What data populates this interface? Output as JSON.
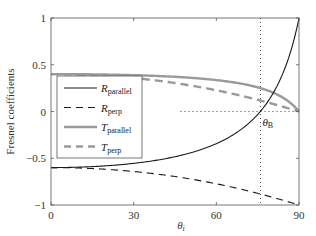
{
  "chart_data": {
    "type": "line",
    "title": "",
    "xlabel": "θi",
    "ylabel": "Fresnel coefficients",
    "xlim": [
      0,
      90
    ],
    "ylim": [
      -1,
      1
    ],
    "xticks": [
      0,
      30,
      60,
      90
    ],
    "yticks": [
      -1,
      -0.5,
      0,
      0.5,
      1
    ],
    "xtick_labels": [
      "0",
      "30",
      "60",
      "90"
    ],
    "ytick_labels": [
      "−1",
      "−0.5",
      "0",
      "0.5",
      "1"
    ],
    "grid": false,
    "legend_position": "center-left",
    "x": [
      0,
      15,
      30,
      45,
      60,
      70,
      76,
      80,
      85,
      90
    ],
    "series": [
      {
        "name": "R_parallel",
        "label_main": "R",
        "label_sub": "parallel",
        "style": "solid",
        "color": "#1a1a1a",
        "width": 1.1,
        "values": [
          -0.6,
          -0.59,
          -0.555,
          -0.484,
          -0.344,
          -0.169,
          0.001,
          0.165,
          0.471,
          1.0
        ]
      },
      {
        "name": "R_perp",
        "label_main": "R",
        "label_sub": "perp",
        "style": "dashed",
        "color": "#1a1a1a",
        "width": 1.1,
        "values": [
          -0.6,
          -0.61,
          -0.642,
          -0.696,
          -0.773,
          -0.838,
          -0.883,
          -0.914,
          -0.956,
          -1.0
        ]
      },
      {
        "name": "T_parallel",
        "label_main": "T",
        "label_sub": "parallel",
        "style": "solid",
        "color": "#9a9a9a",
        "width": 2.4,
        "values": [
          0.4,
          0.397,
          0.389,
          0.371,
          0.336,
          0.292,
          0.25,
          0.209,
          0.132,
          0.0
        ]
      },
      {
        "name": "T_perp",
        "label_main": "T",
        "label_sub": "perp",
        "style": "dashed",
        "color": "#9a9a9a",
        "width": 2.4,
        "values": [
          0.4,
          0.39,
          0.358,
          0.305,
          0.227,
          0.162,
          0.117,
          0.086,
          0.044,
          0.0
        ]
      }
    ],
    "annotations": [
      {
        "type": "vline",
        "x": 76,
        "style": "dotted",
        "label": "θB"
      },
      {
        "type": "hline",
        "y": 0,
        "x_from": 47,
        "x_to": 90,
        "style": "dotted"
      }
    ],
    "refractive_index_ratio": 4
  }
}
